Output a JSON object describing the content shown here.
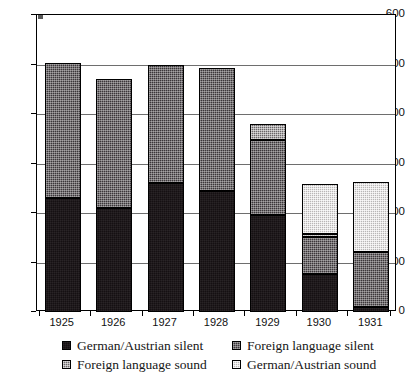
{
  "chart_data": {
    "type": "bar",
    "subtype": "stacked-bar",
    "title": "",
    "xlabel": "",
    "ylabel": "",
    "ylim": [
      0,
      600
    ],
    "ytick_step": 100,
    "yticks": [
      0,
      100,
      200,
      300,
      400,
      500,
      600
    ],
    "ytick_labels": [
      "0",
      "100",
      "200",
      "300",
      "400",
      "500",
      "600"
    ],
    "grid": true,
    "legend_position": "bottom",
    "categories": [
      "1925",
      "1926",
      "1927",
      "1928",
      "1929",
      "1930",
      "1931"
    ],
    "series": [
      {
        "name": "German/Austrian silent",
        "key": "ga-silent",
        "color": "#151012",
        "values": [
          231,
          211,
          261,
          244,
          196,
          77,
          10
        ]
      },
      {
        "name": "Foreign language silent",
        "key": "fl-silent",
        "color": "#3b3639",
        "values": [
          273,
          259,
          238,
          249,
          151,
          75,
          111
        ]
      },
      {
        "name": "Foreign language sound",
        "key": "fl-sound",
        "color": "#6a6668",
        "values": [
          0,
          0,
          0,
          0,
          33,
          5,
          0
        ]
      },
      {
        "name": "German/Austrian sound",
        "key": "ga-sound",
        "color": "#b9b6b6",
        "values": [
          0,
          0,
          0,
          0,
          0,
          101,
          142
        ]
      }
    ],
    "totals": [
      504,
      470,
      499,
      493,
      380,
      258,
      263
    ]
  },
  "axis": {
    "y_labels": [
      "600",
      "500",
      "400",
      "300",
      "200",
      "100",
      "0"
    ],
    "x_labels": [
      "1925",
      "1926",
      "1927",
      "1928",
      "1929",
      "1930",
      "1931"
    ]
  },
  "legend": {
    "items": [
      {
        "label": "German/Austrian silent",
        "key": "ga-silent"
      },
      {
        "label": "Foreign language silent",
        "key": "fl-silent"
      },
      {
        "label": "Foreign language sound",
        "key": "fl-sound"
      },
      {
        "label": "German/Austrian sound",
        "key": "ga-sound"
      }
    ]
  }
}
